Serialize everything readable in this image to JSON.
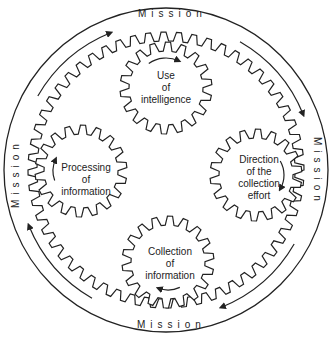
{
  "diagram": {
    "type": "intelligence-cycle-gears",
    "outer_ring_label": "Mission",
    "mission_labels": [
      {
        "position": "top",
        "text": "Mission"
      },
      {
        "position": "right",
        "text": "Mission"
      },
      {
        "position": "bottom",
        "text": "Mission"
      },
      {
        "position": "left",
        "text": "Mission"
      }
    ],
    "gears": [
      {
        "position": "top",
        "lines": [
          "Use",
          "of",
          "intelligence"
        ],
        "rotation": "clockwise"
      },
      {
        "position": "right",
        "lines": [
          "Direction",
          "of the",
          "collection",
          "effort"
        ],
        "rotation": "clockwise"
      },
      {
        "position": "bottom",
        "lines": [
          "Collection",
          "of",
          "information"
        ],
        "rotation": "clockwise"
      },
      {
        "position": "left",
        "lines": [
          "Processing",
          "of",
          "information"
        ],
        "rotation": "clockwise"
      }
    ],
    "outer_arrows": [
      "top-left",
      "top-right",
      "bottom-right",
      "bottom-left"
    ],
    "outer_flow": "clockwise",
    "colors": {
      "stroke": "#222222",
      "background": "#ffffff"
    }
  }
}
